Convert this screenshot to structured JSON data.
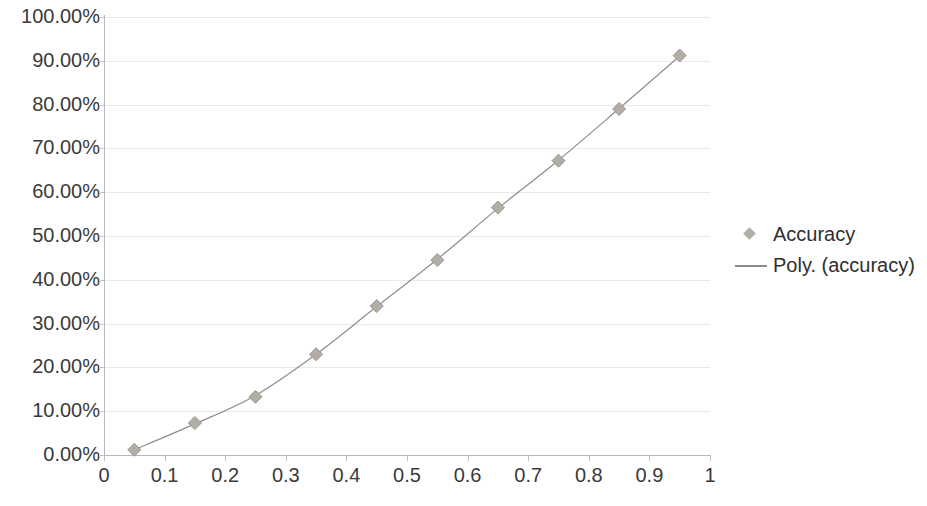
{
  "chart_data": {
    "type": "scatter",
    "title": "",
    "xlabel": "",
    "ylabel": "",
    "xlim": [
      0,
      1
    ],
    "ylim": [
      0,
      1
    ],
    "grid": true,
    "legend_position": "right",
    "x_tick_labels": [
      "0",
      "0.1",
      "0.2",
      "0.3",
      "0.4",
      "0.5",
      "0.6",
      "0.7",
      "0.8",
      "0.9",
      "1"
    ],
    "x_tick_values": [
      0,
      0.1,
      0.2,
      0.3,
      0.4,
      0.5,
      0.6,
      0.7,
      0.8,
      0.9,
      1
    ],
    "y_tick_labels": [
      "0.00%",
      "10.00%",
      "20.00%",
      "30.00%",
      "40.00%",
      "50.00%",
      "60.00%",
      "70.00%",
      "80.00%",
      "90.00%",
      "100.00%"
    ],
    "y_tick_values": [
      0,
      0.1,
      0.2,
      0.3,
      0.4,
      0.5,
      0.6,
      0.7,
      0.8,
      0.9,
      1
    ],
    "x": [
      0.05,
      0.15,
      0.25,
      0.35,
      0.45,
      0.55,
      0.65,
      0.75,
      0.85,
      0.95
    ],
    "series": [
      {
        "name": "Accuracy",
        "type": "scatter",
        "marker": "diamond",
        "color": "#b2aea6",
        "values": [
          0.012,
          0.073,
          0.133,
          0.23,
          0.34,
          0.445,
          0.565,
          0.672,
          0.79,
          0.912
        ]
      },
      {
        "name": "Poly. (accuracy)",
        "type": "line",
        "color": "#8d8d8d",
        "values": [
          0.012,
          0.071,
          0.136,
          0.23,
          0.339,
          0.447,
          0.563,
          0.673,
          0.791,
          0.911
        ]
      }
    ]
  },
  "legend": {
    "items": [
      {
        "label": "Accuracy",
        "key": "diamond-marker",
        "color": "#b2aea6"
      },
      {
        "label": "Poly. (accuracy)",
        "key": "line-marker",
        "color": "#8d8d8d"
      }
    ]
  },
  "colors": {
    "marker": "#b2aea6",
    "trendline": "#8d8d8d",
    "gridline": "#e9e9e9",
    "axis": "#b9b9b9",
    "text": "#3a3a3a",
    "background": "#ffffff"
  }
}
